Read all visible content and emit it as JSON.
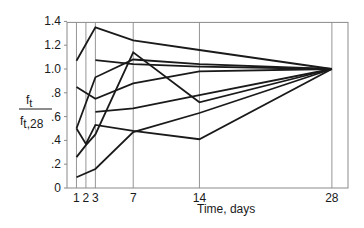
{
  "chart_data": {
    "type": "line",
    "title": "",
    "xlabel": "Time, days",
    "ylabel_numerator": "f",
    "ylabel_numerator_sub": "t",
    "ylabel_denominator": "f",
    "ylabel_denominator_sub": "t,28",
    "ylabel": "f_t / f_t,28",
    "xlim": [
      0,
      29.5
    ],
    "ylim": [
      0,
      1.4
    ],
    "x_ticks": [
      1,
      2,
      3,
      7,
      14,
      28
    ],
    "x_tick_labels": [
      "1",
      "2",
      "3",
      "7",
      "14",
      "28"
    ],
    "y_ticks": [
      0,
      0.2,
      0.4,
      0.6,
      0.8,
      1.0,
      1.2,
      1.4
    ],
    "y_tick_labels": [
      "0",
      ".2",
      ".4",
      ".6",
      ".8",
      "1.0",
      "1.2",
      "1.4"
    ],
    "grid": "vertical lines at x ticks",
    "legend": "none",
    "series": [
      {
        "name": "series-1",
        "x": [
          1,
          3,
          7,
          14,
          28
        ],
        "values": [
          1.07,
          1.35,
          1.24,
          1.16,
          1.0
        ]
      },
      {
        "name": "series-2",
        "x": [
          3,
          7,
          14,
          28
        ],
        "values": [
          1.075,
          1.04,
          1.02,
          1.0
        ]
      },
      {
        "name": "series-3",
        "x": [
          1,
          3,
          7,
          14,
          28
        ],
        "values": [
          0.5,
          0.93,
          1.08,
          1.04,
          1.0
        ]
      },
      {
        "name": "series-4",
        "x": [
          1,
          3,
          7,
          14,
          28
        ],
        "values": [
          0.85,
          0.75,
          0.88,
          0.98,
          1.0
        ]
      },
      {
        "name": "series-5",
        "x": [
          3,
          7,
          14,
          28
        ],
        "values": [
          0.64,
          0.67,
          0.78,
          1.0
        ]
      },
      {
        "name": "series-6",
        "x": [
          1,
          2,
          3,
          7,
          14,
          28
        ],
        "values": [
          0.5,
          0.37,
          0.53,
          0.48,
          0.41,
          1.0
        ]
      },
      {
        "name": "series-7",
        "x": [
          1,
          2,
          3,
          7,
          14,
          28
        ],
        "values": [
          0.26,
          0.36,
          0.45,
          1.14,
          0.72,
          1.0
        ]
      },
      {
        "name": "series-8",
        "x": [
          1,
          3,
          7,
          14,
          28
        ],
        "values": [
          0.09,
          0.16,
          0.47,
          0.63,
          1.0
        ]
      }
    ]
  },
  "style": {
    "line_color": "#1a1a1a",
    "grid_color": "#8a8a8a",
    "frame_color": "#8a8a8a"
  }
}
